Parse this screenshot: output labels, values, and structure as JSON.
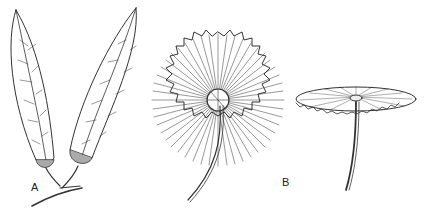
{
  "figure": {
    "panels": [
      {
        "label": "A",
        "description": "Pair of elongated lanceolate leaves with reticulate venation and swollen pulvinus bases on a branched stem"
      },
      {
        "label": "B",
        "description": "Peltate orbicular leaf with radiating veins and dentate margin, shown in top view and side view on a long petiole"
      }
    ]
  }
}
